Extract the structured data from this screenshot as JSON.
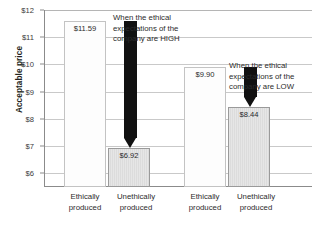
{
  "chart_data": {
    "type": "bar",
    "title": "",
    "xlabel": "",
    "ylabel": "Acceptable price",
    "ylim": [
      5.5,
      12
    ],
    "grid": true,
    "legend_position": "none",
    "y_tick_labels": [
      "$12",
      "$11",
      "$10",
      "$9",
      "$8",
      "$7",
      "$6"
    ],
    "y_tick_values": [
      12,
      11,
      10,
      9,
      8,
      7,
      6
    ],
    "groups": [
      {
        "name": "High ethical expectations",
        "annotation": [
          "When the ethical",
          "expectations of the",
          "company are HIGH"
        ],
        "categories": [
          "Ethically produced",
          "Unethically produced"
        ],
        "values": [
          11.59,
          6.92
        ],
        "value_labels": [
          "$11.59",
          "$6.92"
        ]
      },
      {
        "name": "Low ethical expectations",
        "annotation": [
          "When the ethical",
          "expectations of the",
          "company are LOW"
        ],
        "categories": [
          "Ethically produced",
          "Unethically produced"
        ],
        "values": [
          9.9,
          8.44
        ],
        "value_labels": [
          "$9.90",
          "$8.44"
        ]
      }
    ],
    "annotations": [
      {
        "id": "arrow-high",
        "type": "down-arrow",
        "from": 11.59,
        "to": 6.92
      },
      {
        "id": "arrow-low",
        "type": "down-arrow",
        "from": 9.9,
        "to": 8.44
      }
    ]
  },
  "axis": {
    "y_title": "Acceptable price",
    "ticks": [
      {
        "label": "$12"
      },
      {
        "label": "$11"
      },
      {
        "label": "$10"
      },
      {
        "label": "$9"
      },
      {
        "label": "$8"
      },
      {
        "label": "$7"
      },
      {
        "label": "$6"
      }
    ]
  },
  "bars": {
    "g1b1_value": "$11.59",
    "g1b2_value": "$6.92",
    "g2b1_value": "$9.90",
    "g2b2_value": "$8.44"
  },
  "xlabels": {
    "g1b1_line1": "Ethically",
    "g1b1_line2": "produced",
    "g1b2_line1": "Unethically",
    "g1b2_line2": "produced",
    "g2b1_line1": "Ethically",
    "g2b1_line2": "produced",
    "g2b2_line1": "Unethically",
    "g2b2_line2": "produced"
  },
  "annotations": {
    "high_line1": "When the ethical",
    "high_line2": "expectations of the",
    "high_line3": "company are HIGH",
    "low_line1": "When the ethical",
    "low_line2": "expectations of the",
    "low_line3": "company are LOW"
  },
  "colors": {
    "bar_light": "#fdfdfd",
    "bar_gray": "#e2e2e2",
    "arrow": "#111111",
    "grid": "#c9c9c9",
    "axis": "#8b8b8b",
    "text": "#2b2b2b"
  }
}
